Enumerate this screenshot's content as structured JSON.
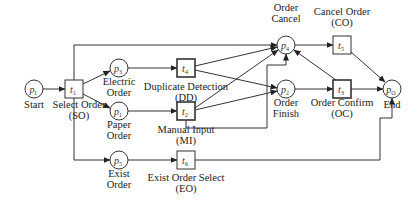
{
  "diagram": {
    "type": "petri-net",
    "places": [
      {
        "id": "p_I",
        "symbol": "p",
        "sub": "I",
        "label": [
          "Start"
        ]
      },
      {
        "id": "p_3",
        "symbol": "p",
        "sub": "3",
        "label": [
          "Electric",
          "Order"
        ]
      },
      {
        "id": "p_1",
        "symbol": "p",
        "sub": "1",
        "label": [
          "Paper",
          "Order"
        ]
      },
      {
        "id": "p_5",
        "symbol": "p",
        "sub": "5",
        "label": [
          "Exist",
          "Order"
        ]
      },
      {
        "id": "p_4",
        "symbol": "p",
        "sub": "4",
        "label": [
          "Order",
          "Cancel"
        ]
      },
      {
        "id": "p_2",
        "symbol": "p",
        "sub": "2",
        "label": [
          "Order",
          "Finish"
        ]
      },
      {
        "id": "p_O",
        "symbol": "p",
        "sub": "O",
        "label": [
          "End"
        ]
      }
    ],
    "transitions": [
      {
        "id": "t_1",
        "symbol": "t",
        "sub": "1",
        "label": [
          "Select Order",
          "(SO)"
        ]
      },
      {
        "id": "t_4",
        "symbol": "t",
        "sub": "4",
        "label": [
          "Duplicate Detection",
          "(DD)"
        ]
      },
      {
        "id": "t_2",
        "symbol": "t",
        "sub": "2",
        "label": [
          "Manual Input",
          "(MI)"
        ]
      },
      {
        "id": "t_6",
        "symbol": "t",
        "sub": "6",
        "label": [
          "Exist Order Select",
          "(EO)"
        ]
      },
      {
        "id": "t_5",
        "symbol": "t",
        "sub": "5",
        "label": [
          "Cancel Order",
          "(CO)"
        ]
      },
      {
        "id": "t_3",
        "symbol": "t",
        "sub": "3",
        "label": [
          "Order Confirm",
          "(OC)"
        ]
      }
    ],
    "arcs": [
      [
        "p_I",
        "t_1"
      ],
      [
        "t_1",
        "p_3"
      ],
      [
        "t_1",
        "p_1"
      ],
      [
        "t_1",
        "p_5"
      ],
      [
        "t_1",
        "p_4"
      ],
      [
        "p_3",
        "t_4"
      ],
      [
        "p_1",
        "t_2"
      ],
      [
        "p_5",
        "t_6"
      ],
      [
        "t_4",
        "p_4"
      ],
      [
        "t_4",
        "p_2"
      ],
      [
        "t_2",
        "p_4"
      ],
      [
        "t_2",
        "p_2"
      ],
      [
        "t_2",
        "p_4"
      ],
      [
        "t_6",
        "p_O"
      ],
      [
        "p_4",
        "t_5"
      ],
      [
        "t_5",
        "p_O"
      ],
      [
        "p_2",
        "t_3"
      ],
      [
        "t_3",
        "p_O"
      ],
      [
        "t_3",
        "p_4"
      ]
    ]
  }
}
